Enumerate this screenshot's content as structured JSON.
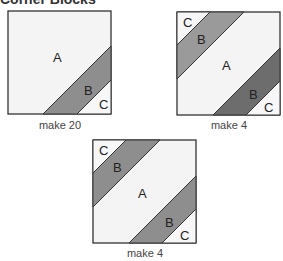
{
  "heading": "Corner Blocks",
  "colors": {
    "fabric_a": "#f4f4f4",
    "fabric_b": "#8e8e8e",
    "fabric_b_dark": "#6d6d6d",
    "fabric_c": "#f4f4f4",
    "outline": "#333333"
  },
  "blocks": [
    {
      "name": "single-corner-block",
      "labels": {
        "a": "A",
        "b": "B",
        "c": "C"
      },
      "caption": "make 20"
    },
    {
      "name": "double-corner-block-dark",
      "labels": {
        "a": "A",
        "b1": "B",
        "c1": "C",
        "b2": "B",
        "c2": "C"
      },
      "caption": "make 4"
    },
    {
      "name": "double-corner-block",
      "labels": {
        "a": "A",
        "b1": "B",
        "c1": "C",
        "b2": "B",
        "c2": "C"
      },
      "caption": "make 4"
    }
  ]
}
